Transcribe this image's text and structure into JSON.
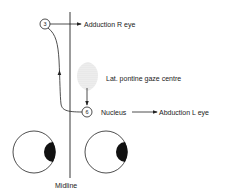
{
  "diagram": {
    "labels": {
      "adduction": "Adduction R eye",
      "pontine": "Lat. pontine gaze centre",
      "nucleus": "Nucleus",
      "abduction": "Abduction L eye",
      "midline": "Midline"
    },
    "nuclei": {
      "third": "3",
      "sixth": "6"
    },
    "colors": {
      "line": "#222222",
      "background": "#ffffff"
    }
  }
}
